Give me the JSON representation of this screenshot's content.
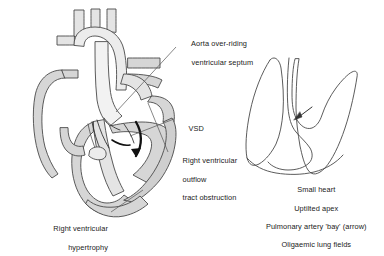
{
  "figure": {
    "background_color": "#ffffff",
    "line_color": "#333333",
    "text_color": "#1a1a1a",
    "fill_mid_grey": "#d6d6d6",
    "fill_light_grey": "#ececec",
    "fill_pale_grey": "#f2f2f2"
  },
  "heart_diagram": {
    "name": "cardiac-cross-section",
    "labels": {
      "aorta": {
        "line1": "Aorta over-riding",
        "line2": "ventricular septum"
      },
      "vsd": {
        "text": "VSD"
      },
      "rvoto": {
        "line1": "Right ventricular",
        "line2": "outflow",
        "line3": "tract obstruction"
      },
      "rvh": {
        "line1": "Right ventricular",
        "line2": "hypertrophy"
      }
    }
  },
  "chest_xray": {
    "name": "chest-radiograph-schematic",
    "arrow_label": "pulmonary-artery-bay-arrow",
    "caption": {
      "line1": "Small heart",
      "line2": "Uptilted apex",
      "line3": "Pulmonary artery 'bay' (arrow)",
      "line4": "Oligaemic lung fields"
    }
  }
}
